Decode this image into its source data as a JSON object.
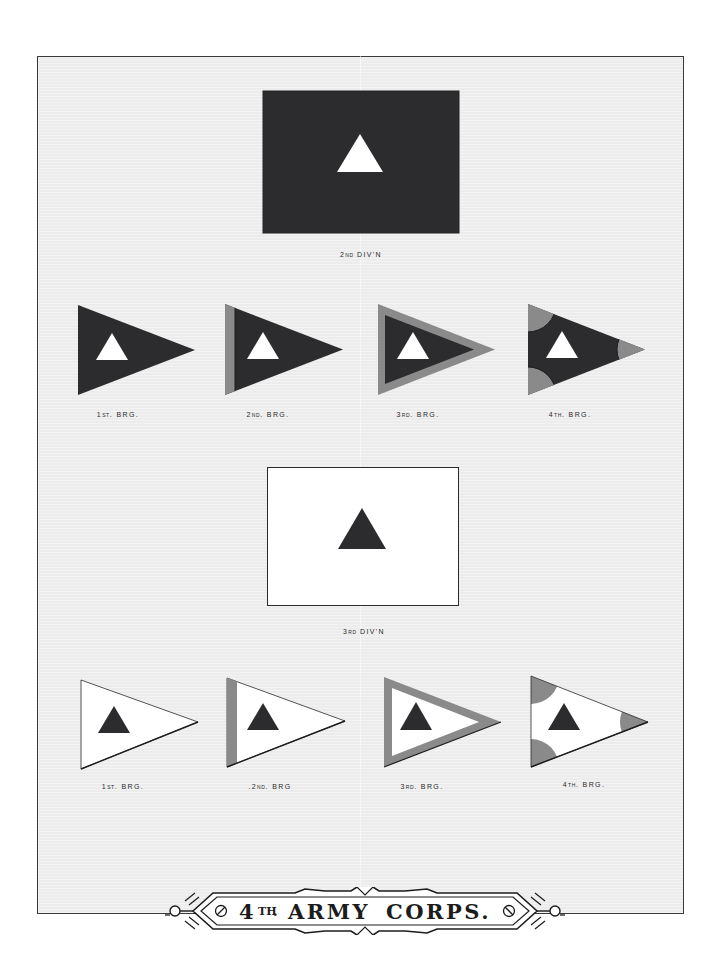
{
  "plate": {
    "background": "#ececec",
    "border": "#3a3a3a",
    "title": {
      "number": "4",
      "suffix": "TH",
      "dot": ".",
      "word1": "ARMY",
      "word2": "CORPS."
    }
  },
  "colors": {
    "dark": "#2c2c2e",
    "white": "#ffffff",
    "gray": "#8a8a8a",
    "outline": "#2a2a2a"
  },
  "divisions": [
    {
      "name": "2nd Division",
      "label_main": "2",
      "label_sup": "ND",
      "label_rest": " DIV'N",
      "flag_field": "dark",
      "emblem": "white triangle",
      "brigades": [
        {
          "label_main": "1",
          "label_sup": "ST",
          "label_rest": ". BRG.",
          "style": "plain"
        },
        {
          "label_main": "2",
          "label_sup": "ND",
          "label_rest": ". BRG.",
          "style": "hoist stripe"
        },
        {
          "label_main": "3",
          "label_sup": "RD",
          "label_rest": ". BRG.",
          "style": "border"
        },
        {
          "label_main": "4",
          "label_sup": "TH",
          "label_rest": ". BRG.",
          "style": "corner discs"
        }
      ]
    },
    {
      "name": "3rd Division",
      "label_main": "3",
      "label_sup": "RD",
      "label_rest": " DIV'N",
      "flag_field": "white",
      "emblem": "dark triangle",
      "brigades": [
        {
          "label_main": "1",
          "label_sup": "ST",
          "label_rest": ". BRG.",
          "style": "plain"
        },
        {
          "label_main": ".2",
          "label_sup": "ND",
          "label_rest": ". BRG",
          "style": "hoist stripe"
        },
        {
          "label_main": "3",
          "label_sup": "RD",
          "label_rest": ". BRG.",
          "style": "border"
        },
        {
          "label_main": "4",
          "label_sup": "TH",
          "label_rest": ". BRG.",
          "style": "corner discs"
        }
      ]
    }
  ]
}
